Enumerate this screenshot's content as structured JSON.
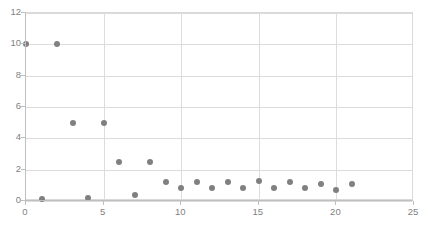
{
  "chart_data": {
    "type": "scatter",
    "title": "",
    "subtitle": "",
    "xlabel": "",
    "ylabel": "",
    "xlim": [
      0,
      25
    ],
    "ylim": [
      0,
      12
    ],
    "xticks": [
      0,
      5,
      10,
      15,
      20,
      25
    ],
    "yticks": [
      0,
      2,
      4,
      6,
      8,
      10,
      12
    ],
    "xtick_labels": [
      "0",
      "5",
      "10",
      "15",
      "20",
      "25"
    ],
    "ytick_labels": [
      "0",
      "2",
      "4",
      "6",
      "8",
      "10",
      "12"
    ],
    "grid": "horizontal-and-vertical",
    "legend": "none",
    "annotations": [],
    "series": [
      {
        "name": "Series 1",
        "marker": "circle",
        "color": "#808080",
        "points": [
          {
            "x": 0,
            "y": 10.0
          },
          {
            "x": 1,
            "y": 0.1
          },
          {
            "x": 2,
            "y": 10.0
          },
          {
            "x": 3,
            "y": 5.0
          },
          {
            "x": 4,
            "y": 0.2
          },
          {
            "x": 5,
            "y": 5.0
          },
          {
            "x": 6,
            "y": 2.5
          },
          {
            "x": 7,
            "y": 0.4
          },
          {
            "x": 8,
            "y": 2.5
          },
          {
            "x": 9,
            "y": 1.2
          },
          {
            "x": 10,
            "y": 0.8
          },
          {
            "x": 11,
            "y": 1.2
          },
          {
            "x": 12,
            "y": 0.8
          },
          {
            "x": 13,
            "y": 1.2
          },
          {
            "x": 14,
            "y": 0.8
          },
          {
            "x": 15,
            "y": 1.3
          },
          {
            "x": 16,
            "y": 0.8
          },
          {
            "x": 17,
            "y": 1.2
          },
          {
            "x": 18,
            "y": 0.8
          },
          {
            "x": 19,
            "y": 1.1
          },
          {
            "x": 20,
            "y": 0.7
          },
          {
            "x": 21,
            "y": 1.1
          }
        ]
      }
    ],
    "colors": {
      "marker": "#808080",
      "gridline": "#dcdcdc",
      "axis": "#bfbfbf",
      "tick_label": "#7f7f7f",
      "background": "#ffffff"
    }
  }
}
